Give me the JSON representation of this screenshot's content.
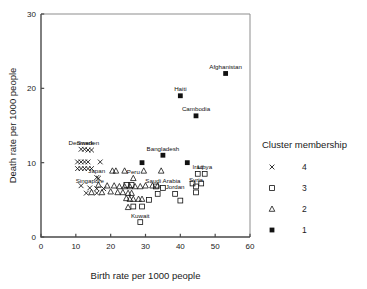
{
  "chart_data": {
    "type": "scatter",
    "title": "",
    "xlabel": "Birth rate per 1000 people",
    "ylabel": "Death rate per 1000 people",
    "xlim": [
      0,
      60
    ],
    "ylim": [
      0,
      30
    ],
    "xticks": [
      "0",
      "10",
      "20",
      "30",
      "40",
      "50",
      "60"
    ],
    "yticks": [
      "0",
      "10",
      "20",
      "30"
    ],
    "grid": false,
    "legend_position": "right",
    "legend_title": "Cluster membership",
    "series": [
      {
        "name": "1",
        "marker": "filled-square",
        "points": [
          {
            "x": 53.0,
            "y": 22.0,
            "label": "Afghanistan"
          },
          {
            "x": 40.0,
            "y": 19.0,
            "label": "Haiti"
          },
          {
            "x": 44.5,
            "y": 16.3,
            "label": "Cambodia"
          },
          {
            "x": 35.0,
            "y": 11.0,
            "label": "Bangladesh"
          },
          {
            "x": 29.0,
            "y": 10.0,
            "label": ""
          },
          {
            "x": 42.0,
            "y": 10.0,
            "label": ""
          }
        ]
      },
      {
        "name": "2",
        "marker": "open-triangle",
        "points": [
          {
            "x": 20.5,
            "y": 8.9,
            "label": ""
          },
          {
            "x": 21.5,
            "y": 8.9,
            "label": ""
          },
          {
            "x": 24.0,
            "y": 8.9,
            "label": ""
          },
          {
            "x": 29.5,
            "y": 8.9,
            "label": ""
          },
          {
            "x": 34.5,
            "y": 8.9,
            "label": ""
          },
          {
            "x": 26.5,
            "y": 7.9,
            "label": "Peru"
          },
          {
            "x": 16.5,
            "y": 7.0,
            "label": ""
          },
          {
            "x": 19.0,
            "y": 6.9,
            "label": ""
          },
          {
            "x": 21.0,
            "y": 6.9,
            "label": ""
          },
          {
            "x": 22.5,
            "y": 6.8,
            "label": ""
          },
          {
            "x": 24.0,
            "y": 6.8,
            "label": ""
          },
          {
            "x": 25.5,
            "y": 6.8,
            "label": ""
          },
          {
            "x": 27.0,
            "y": 6.8,
            "label": ""
          },
          {
            "x": 28.5,
            "y": 6.8,
            "label": ""
          },
          {
            "x": 30.0,
            "y": 6.9,
            "label": ""
          },
          {
            "x": 32.0,
            "y": 6.9,
            "label": ""
          },
          {
            "x": 33.5,
            "y": 6.9,
            "label": ""
          },
          {
            "x": 14.5,
            "y": 6.0,
            "label": ""
          },
          {
            "x": 17.5,
            "y": 6.0,
            "label": ""
          },
          {
            "x": 20.0,
            "y": 6.1,
            "label": ""
          },
          {
            "x": 22.0,
            "y": 6.0,
            "label": ""
          },
          {
            "x": 23.5,
            "y": 6.0,
            "label": ""
          },
          {
            "x": 25.0,
            "y": 5.9,
            "label": ""
          },
          {
            "x": 26.0,
            "y": 5.9,
            "label": ""
          },
          {
            "x": 24.5,
            "y": 5.2,
            "label": ""
          },
          {
            "x": 25.5,
            "y": 5.1,
            "label": ""
          },
          {
            "x": 26.5,
            "y": 5.1,
            "label": ""
          },
          {
            "x": 28.0,
            "y": 5.1,
            "label": ""
          },
          {
            "x": 29.0,
            "y": 5.1,
            "label": ""
          },
          {
            "x": 25.0,
            "y": 4.0,
            "label": ""
          }
        ]
      },
      {
        "name": "3",
        "marker": "open-square",
        "points": [
          {
            "x": 45.0,
            "y": 8.5,
            "label": "Iraq"
          },
          {
            "x": 47.0,
            "y": 8.5,
            "label": "Libya"
          },
          {
            "x": 43.5,
            "y": 7.2,
            "label": ""
          },
          {
            "x": 46.0,
            "y": 7.2,
            "label": ""
          },
          {
            "x": 24.5,
            "y": 7.0,
            "label": ""
          },
          {
            "x": 26.0,
            "y": 7.0,
            "label": ""
          },
          {
            "x": 33.0,
            "y": 6.8,
            "label": ""
          },
          {
            "x": 35.0,
            "y": 6.6,
            "label": "Saudi Arabia"
          },
          {
            "x": 44.5,
            "y": 6.8,
            "label": "Syria"
          },
          {
            "x": 33.5,
            "y": 5.8,
            "label": ""
          },
          {
            "x": 38.5,
            "y": 5.8,
            "label": "Jordan"
          },
          {
            "x": 44.5,
            "y": 6.0,
            "label": ""
          },
          {
            "x": 31.0,
            "y": 5.0,
            "label": ""
          },
          {
            "x": 40.0,
            "y": 4.9,
            "label": ""
          },
          {
            "x": 26.5,
            "y": 4.1,
            "label": ""
          },
          {
            "x": 29.0,
            "y": 4.1,
            "label": ""
          },
          {
            "x": 28.5,
            "y": 2.0,
            "label": "Kuwait"
          }
        ]
      },
      {
        "name": "4",
        "marker": "cross",
        "points": [
          {
            "x": 11.5,
            "y": 11.8,
            "label": "Denmark"
          },
          {
            "x": 12.5,
            "y": 11.8,
            "label": ""
          },
          {
            "x": 13.5,
            "y": 11.7,
            "label": "Sweden"
          },
          {
            "x": 14.5,
            "y": 11.7,
            "label": ""
          },
          {
            "x": 10.5,
            "y": 10.1,
            "label": ""
          },
          {
            "x": 11.5,
            "y": 10.1,
            "label": ""
          },
          {
            "x": 12.5,
            "y": 10.1,
            "label": ""
          },
          {
            "x": 13.5,
            "y": 10.1,
            "label": ""
          },
          {
            "x": 17.0,
            "y": 10.1,
            "label": ""
          },
          {
            "x": 10.5,
            "y": 9.2,
            "label": ""
          },
          {
            "x": 11.5,
            "y": 9.2,
            "label": ""
          },
          {
            "x": 12.5,
            "y": 9.2,
            "label": ""
          },
          {
            "x": 13.5,
            "y": 9.2,
            "label": ""
          },
          {
            "x": 14.5,
            "y": 9.2,
            "label": ""
          },
          {
            "x": 16.0,
            "y": 8.0,
            "label": "Japan"
          },
          {
            "x": 16.5,
            "y": 7.9,
            "label": ""
          },
          {
            "x": 11.5,
            "y": 6.9,
            "label": ""
          },
          {
            "x": 14.0,
            "y": 6.6,
            "label": "Singapore"
          },
          {
            "x": 16.0,
            "y": 6.5,
            "label": ""
          },
          {
            "x": 18.0,
            "y": 6.5,
            "label": ""
          },
          {
            "x": 13.0,
            "y": 5.9,
            "label": ""
          },
          {
            "x": 16.0,
            "y": 5.9,
            "label": ""
          }
        ]
      }
    ],
    "legend_entries": [
      {
        "marker": "cross",
        "label": "4"
      },
      {
        "marker": "open-square",
        "label": "3"
      },
      {
        "marker": "open-triangle",
        "label": "2"
      },
      {
        "marker": "filled-square",
        "label": "1"
      }
    ]
  }
}
